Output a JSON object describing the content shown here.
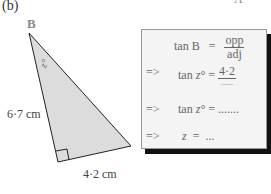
{
  "figure": {
    "part_label": "(b)",
    "corner_label": "A",
    "vertex_label": "B",
    "angle_label": "z°",
    "side_left": "6·7 cm",
    "side_bottom": "4·2 cm",
    "triangle": {
      "vertices": [
        [
          29,
          33
        ],
        [
          58,
          162
        ],
        [
          131,
          146
        ]
      ],
      "fill": "#dcdcdc",
      "stroke": "#222222",
      "right_angle_at": [
        58,
        162
      ]
    }
  },
  "workbox": {
    "line1": {
      "lhs": "tan B",
      "eq": "=",
      "num": "opp",
      "den": "adj"
    },
    "line2": {
      "arrow": "=>",
      "lhs_fn": "tan",
      "lhs_var": "z°",
      "eq": "=",
      "num": "4·2",
      "den": "......"
    },
    "line3": {
      "arrow": "=>",
      "lhs_fn": "tan",
      "lhs_var": "z°",
      "eq": "=",
      "rhs": "......."
    },
    "line4": {
      "arrow": "=>",
      "lhs_var": "z",
      "eq": "=",
      "rhs": "..."
    }
  }
}
